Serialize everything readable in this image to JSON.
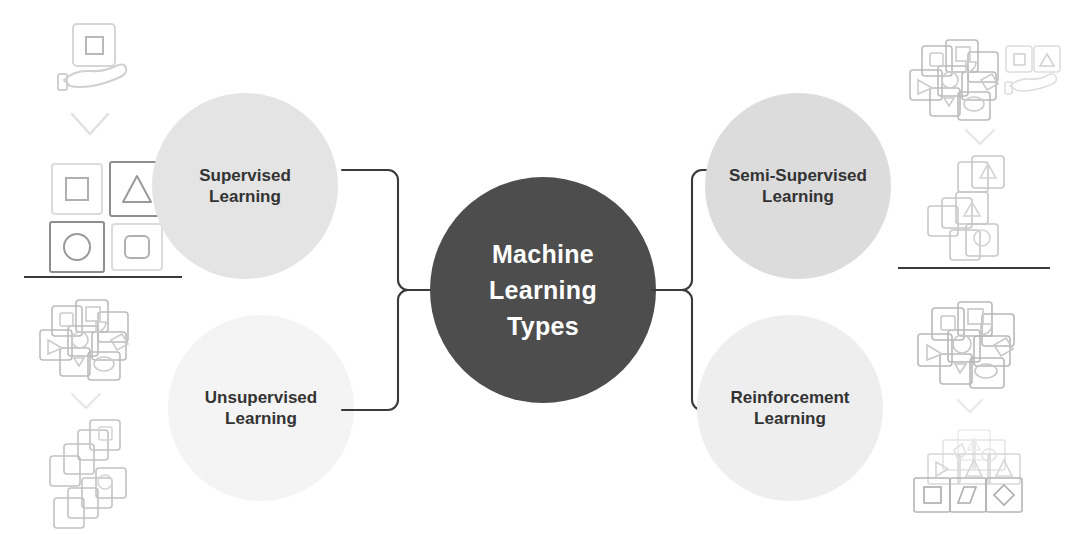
{
  "diagram": {
    "center": {
      "label": "Machine\nLearning\nTypes",
      "fill": "#4d4d4d",
      "text_color": "#ffffff"
    },
    "nodes": [
      {
        "id": "supervised",
        "label": "Supervised\nLearning",
        "fill": "#e4e4e4",
        "text_color": "#333333",
        "side": "left",
        "position": "top"
      },
      {
        "id": "unsupervised",
        "label": "Unsupervised\nLearning",
        "fill": "#f4f4f4",
        "text_color": "#333333",
        "side": "left",
        "position": "bottom"
      },
      {
        "id": "semi-supervised",
        "label": "Semi-Supervised\nLearning",
        "fill": "#dcdcdc",
        "text_color": "#333333",
        "side": "right",
        "position": "top"
      },
      {
        "id": "reinforcement",
        "label": "Reinforcement\nLearning",
        "fill": "#eeeeee",
        "text_color": "#333333",
        "side": "right",
        "position": "bottom"
      }
    ],
    "connectors": [
      {
        "id": "left-bracket",
        "shape": "curly-bracket",
        "color": "#3a3a3a"
      },
      {
        "id": "right-bracket",
        "shape": "curly-bracket",
        "color": "#3a3a3a"
      }
    ],
    "dividers": [
      {
        "id": "divider-left",
        "color": "#3a3a3a"
      },
      {
        "id": "divider-right",
        "color": "#3a3a3a"
      }
    ],
    "illustrations": [
      {
        "id": "supervised-illustration",
        "for": "supervised",
        "parts": [
          "labeled-card-on-hand",
          "chevron-down-arrow",
          "labeled-shape-grid-2x2"
        ],
        "stroke": "#c9c9c9"
      },
      {
        "id": "unsupervised-illustration",
        "for": "unsupervised",
        "parts": [
          "unlabeled-card-cluster",
          "chevron-down-arrow",
          "clustered-card-groups"
        ],
        "stroke": "#c9c9c9"
      },
      {
        "id": "semi-supervised-illustration",
        "for": "semi-supervised",
        "parts": [
          "unlabeled-card-cluster",
          "labeled-card-pair-on-hand",
          "chevron-down-arrow",
          "clustered-card-groups"
        ],
        "stroke": "#c9c9c9"
      },
      {
        "id": "reinforcement-illustration",
        "for": "reinforcement",
        "parts": [
          "unlabeled-card-cluster",
          "chevron-down-arrow",
          "stacked-tile-pyramid"
        ],
        "stroke": "#c9c9c9"
      }
    ]
  }
}
